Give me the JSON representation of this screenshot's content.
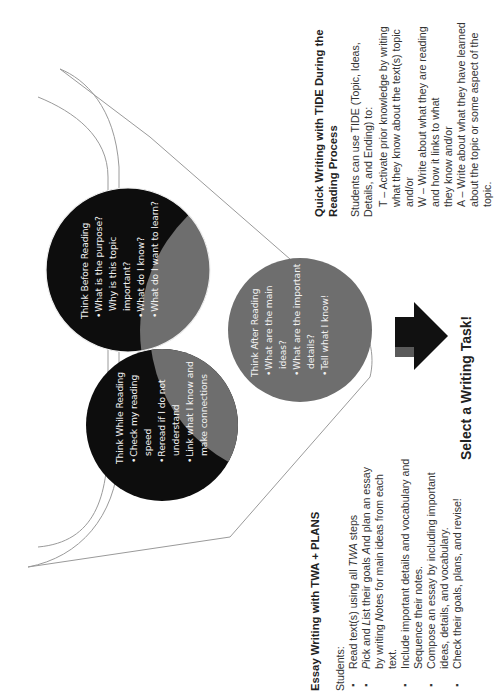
{
  "diagram": {
    "orientation": "rotated 90 degrees counter-clockwise",
    "circles": {
      "before": {
        "title": "Think Before Reading",
        "items": [
          "What is the purpose? Why is this topic important?",
          "What do I know?",
          "What do I want to learn?"
        ],
        "color": "#0d0d0d"
      },
      "while": {
        "title": "Think While Reading",
        "items": [
          "Check my reading speed",
          "Reread if I do not understand",
          "Link what I know and make connections"
        ],
        "color": "#0d0d0d"
      },
      "after": {
        "title": "Think After Reading",
        "items": [
          "What are the main ideas?",
          "What are the important details?",
          "Tell what I know!"
        ],
        "color": "#6e6e6e"
      }
    },
    "overlap_color": "#6e6e6e",
    "funnel_stroke": "#9a9a9a",
    "arrow_color": "#111111",
    "arrow_stem_color": "#5a5a5a"
  },
  "tide": {
    "heading_line1": "Quick Writing with TIDE During the",
    "heading_line2": "Reading Process",
    "intro_line1": "Students can use TIDE (Topic, Ideas,",
    "intro_line2": "Details, and Ending) to:",
    "lines": [
      "T – Activate prior knowledge by writing",
      "what they know about the text(s) topic",
      "and/or",
      "W – Write about what they are reading",
      "and how it links to what",
      "they know and/or",
      "A – Write about what they have learned",
      "about the topic or some aspect of the",
      "topic."
    ]
  },
  "select_task": "Select a Writing Task!",
  "plans": {
    "heading": "Essay Writing with TWA + PLANS",
    "intro": "Students:",
    "items": [
      {
        "pre": "Read text(s) using all ",
        "em": "TWA",
        "post": " steps"
      },
      {
        "pre": "",
        "em": "P",
        "post": "ick and ",
        "em2": "L",
        "post2": "ist their goals ",
        "em3": "A",
        "post3": "nd plan an essay by writing ",
        "em4": "N",
        "post4": "otes for main ideas from each text."
      },
      {
        "pre": "Include important details and vocabulary and Sequence their notes."
      },
      {
        "pre": "Compose an essay by including important ideas, details, and vocabulary."
      },
      {
        "pre": "Check their goals, plans, and revise!"
      }
    ]
  }
}
